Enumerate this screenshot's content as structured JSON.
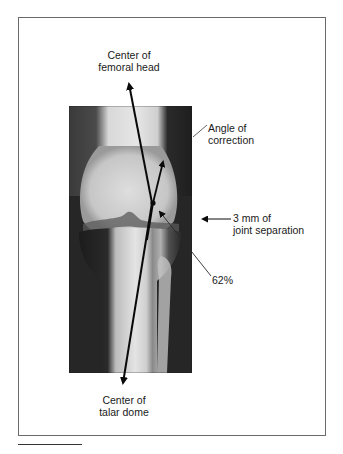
{
  "figure": {
    "labels": {
      "femoral_head": [
        "Center of",
        "femoral head"
      ],
      "angle_correction": [
        "Angle of",
        "correction"
      ],
      "joint_separation": [
        "3 mm of",
        "joint separation"
      ],
      "percent": "62%",
      "talar_dome": [
        "Center of",
        "talar dome"
      ]
    },
    "image_description": "AP knee radiograph with mechanical axis line drawn from center of femoral head to center of talar dome",
    "colors": {
      "line": "#0a0a0a",
      "border": "#6a6a6a",
      "text": "#1a1a1a"
    }
  },
  "caption": {
    "visible_text": ""
  }
}
